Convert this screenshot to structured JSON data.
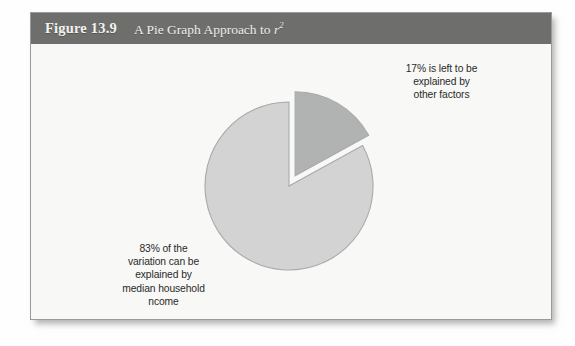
{
  "figure": {
    "number_label": "Figure 13.9",
    "title_text": "A Pie Graph Approach to ",
    "title_symbol": "r",
    "title_superscript": "2",
    "header_color": "#6e6f6d",
    "panel_background": "#f8f8f6",
    "border_color": "#9a9a98"
  },
  "chart_data": {
    "type": "pie",
    "title": "A Pie Graph Approach to r2",
    "categories": [
      "83% of the variation can be explained by median household income",
      "17% is left to be explained by other factors"
    ],
    "values": [
      83,
      17
    ],
    "unit": "percent",
    "colors": [
      "#d2d3d2",
      "#b1b3b2"
    ],
    "slice_edge_color": "#a8aaa9",
    "exploded_slice_index": 1,
    "explode_offset_px": 12,
    "start_angle_deg": 0,
    "rotation_note": "large slice starts at 12 o'clock going counter-clockwise; small slice occupies 12 o'clock to ~4 o'clock clockwise",
    "legend": "none",
    "grid": false,
    "xlabel": "",
    "ylabel": "",
    "annotations": [
      {
        "name": "other-factors",
        "value": 17,
        "lines": [
          "17% is left to be",
          "explained by",
          "other factors"
        ]
      },
      {
        "name": "variation-explained",
        "value": 83,
        "lines": [
          "83% of the",
          "variation can be",
          "explained by",
          "median household",
          "ncome"
        ]
      }
    ]
  }
}
